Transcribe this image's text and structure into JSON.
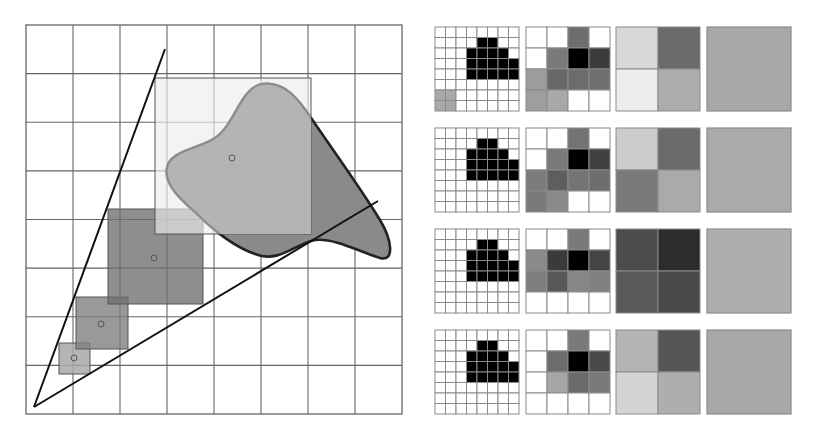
{
  "diagram": {
    "left_panel": {
      "grid": {
        "x": 26,
        "y": 25,
        "width": 376,
        "height": 389,
        "cols": 8,
        "rows": 8,
        "line_color": "#666666"
      },
      "cone": {
        "apex": [
          34,
          407
        ],
        "upper_end": [
          165,
          49
        ],
        "lower_end": [
          378,
          201
        ],
        "stroke": "#111111"
      },
      "sample_squares": [
        {
          "name": "level-0",
          "x": 59,
          "y": 343,
          "size": 31,
          "center": [
            74,
            358
          ],
          "fill": "#a8a8a8",
          "opacity": 0.85
        },
        {
          "name": "level-1",
          "x": 76,
          "y": 297,
          "size": 52,
          "center": [
            101,
            324
          ],
          "fill": "#7f7f7f",
          "opacity": 0.8
        },
        {
          "name": "level-2",
          "x": 108,
          "y": 209,
          "size": 95,
          "center": [
            154,
            258
          ],
          "fill": "#6e6e6e",
          "opacity": 0.78
        },
        {
          "name": "level-3",
          "x": 155,
          "y": 78,
          "size": 156,
          "center": [
            232,
            158
          ],
          "fill": "#ececec",
          "opacity": 0.65
        }
      ],
      "blob": {
        "fill_inside": "#b4b4b4",
        "fill_outside": "#8a8a8a",
        "stroke": "#222222"
      }
    },
    "right_panel": {
      "rows": 4,
      "columns": [
        "8x8",
        "4x4",
        "2x2",
        "1x1"
      ],
      "tile_size": 84,
      "tiles": [
        {
          "fine_gray_cells": [
            [
              6,
              0
            ],
            [
              6,
              1
            ],
            [
              7,
              0
            ],
            [
              7,
              1
            ]
          ],
          "level4": [
            [
              "#ffffff",
              "#ffffff",
              "#6e6e6e",
              "#ffffff"
            ],
            [
              "#ffffff",
              "#7a7a7a",
              "#000000",
              "#3c3c3c"
            ],
            [
              "#9c9c9c",
              "#686868",
              "#6c6c6c",
              "#707070"
            ],
            [
              "#9e9e9e",
              "#a8a8a8",
              "#ffffff",
              "#ffffff"
            ]
          ],
          "level2": [
            [
              "#d8d8d8",
              "#6a6a6a"
            ],
            [
              "#ececec",
              "#acacac"
            ]
          ],
          "level1": "#a8a8a8"
        },
        {
          "fine_gray_cells": [],
          "level4": [
            [
              "#ffffff",
              "#ffffff",
              "#737373",
              "#ffffff"
            ],
            [
              "#ffffff",
              "#7a7a7a",
              "#000000",
              "#404040"
            ],
            [
              "#7c7c7c",
              "#5e5e5e",
              "#747474",
              "#6e6e6e"
            ],
            [
              "#7a7a7a",
              "#8a8a8a",
              "#ffffff",
              "#ffffff"
            ]
          ],
          "level2": [
            [
              "#cccccc",
              "#6a6a6a"
            ],
            [
              "#7a7a7a",
              "#aaaaaa"
            ]
          ],
          "level1": "#aaaaaa"
        },
        {
          "fine_gray_cells": [],
          "level4": [
            [
              "#ffffff",
              "#ffffff",
              "#7a7a7a",
              "#ffffff"
            ],
            [
              "#8a8a8a",
              "#3a3a3a",
              "#000000",
              "#444444"
            ],
            [
              "#7e7e7e",
              "#585858",
              "#868686",
              "#808080"
            ],
            [
              "#ffffff",
              "#ffffff",
              "#ffffff",
              "#ffffff"
            ]
          ],
          "level2": [
            [
              "#4c4c4c",
              "#2c2c2c"
            ],
            [
              "#5a5a5a",
              "#4a4a4a"
            ]
          ],
          "level1": "#aeaeae"
        },
        {
          "fine_gray_cells": [],
          "level4": [
            [
              "#ffffff",
              "#ffffff",
              "#7a7a7a",
              "#ffffff"
            ],
            [
              "#ffffff",
              "#6c6c6c",
              "#000000",
              "#4a4a4a"
            ],
            [
              "#ffffff",
              "#a6a6a6",
              "#6a6a6a",
              "#7a7a7a"
            ],
            [
              "#ffffff",
              "#ffffff",
              "#ffffff",
              "#ffffff"
            ]
          ],
          "level2": [
            [
              "#b4b4b4",
              "#555555"
            ],
            [
              "#d4d4d4",
              "#aeaeae"
            ]
          ],
          "level1": "#a8a8a8"
        }
      ],
      "black_shape_cells": [
        [
          1,
          4
        ],
        [
          1,
          5
        ],
        [
          2,
          3
        ],
        [
          2,
          4
        ],
        [
          2,
          5
        ],
        [
          2,
          6
        ],
        [
          3,
          3
        ],
        [
          3,
          4
        ],
        [
          3,
          5
        ],
        [
          3,
          6
        ],
        [
          3,
          7
        ],
        [
          4,
          3
        ],
        [
          4,
          4
        ],
        [
          4,
          5
        ],
        [
          4,
          6
        ],
        [
          4,
          7
        ]
      ]
    }
  }
}
